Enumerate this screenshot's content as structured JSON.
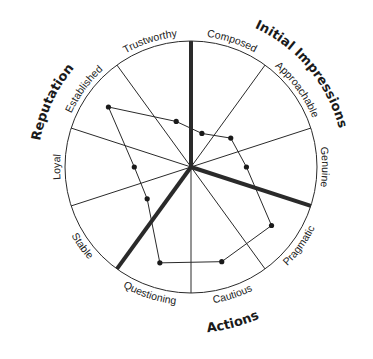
{
  "chart_data": {
    "type": "radar",
    "title": "",
    "center": [
      191,
      167
    ],
    "radius": 126,
    "range": [
      0,
      1
    ],
    "grid": {
      "outer_circle": true,
      "spokes": 10
    },
    "categories": [
      "Composed",
      "Approachable",
      "Genuine",
      "Pragmatic",
      "Cautious",
      "Questioning",
      "Stable",
      "Loyal",
      "Established",
      "Trustworthy"
    ],
    "category_angles_deg": [
      18,
      54,
      90,
      126,
      162,
      198,
      234,
      270,
      306,
      342
    ],
    "spoke_angles_deg": [
      0,
      36,
      72,
      108,
      144,
      180,
      216,
      252,
      288,
      324
    ],
    "thick_spokes_deg": [
      0,
      108,
      216
    ],
    "series": [
      {
        "name": "Profile",
        "values": [
          0.28,
          0.39,
          0.44,
          0.79,
          0.79,
          0.8,
          0.43,
          0.45,
          0.81,
          0.38
        ]
      }
    ],
    "groups": [
      {
        "label": "Initial Impressions",
        "members": [
          "Composed",
          "Approachable",
          "Genuine"
        ],
        "angle_deg": 50
      },
      {
        "label": "Actions",
        "members": [
          "Pragmatic",
          "Cautious",
          "Questioning"
        ],
        "angle_deg": 165
      },
      {
        "label": "Reputation",
        "members": [
          "Stable",
          "Loyal",
          "Established",
          "Trustworthy"
        ],
        "angle_deg": 295
      }
    ],
    "colors": {
      "line": "#2a2a2a",
      "thick_spoke": "#2a2a2a",
      "point": "#1a1a1a",
      "text": "#222222"
    }
  }
}
